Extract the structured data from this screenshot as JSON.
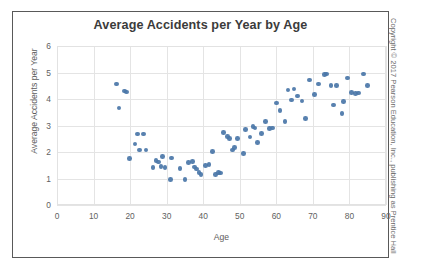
{
  "figure": {
    "copyright": "Copyright © 2017 Pearson Education, Inc., publishing as Prentice Hall"
  },
  "chart_data": {
    "type": "scatter",
    "title": "Average Accidents per Year by Age",
    "xlabel": "Age",
    "ylabel": "Average Accidents per Year",
    "xlim": [
      0,
      90
    ],
    "ylim": [
      0,
      6
    ],
    "xticks": [
      0,
      10,
      20,
      30,
      40,
      50,
      60,
      70,
      80,
      90
    ],
    "yticks": [
      0,
      1,
      2,
      3,
      4,
      5,
      6
    ],
    "grid": true,
    "legend": null,
    "marker_color": "#4a76a8",
    "series": [
      {
        "name": "Drivers",
        "points": [
          [
            16.2,
            4.56
          ],
          [
            17.0,
            3.66
          ],
          [
            18.4,
            4.3
          ],
          [
            19.0,
            4.27
          ],
          [
            19.8,
            1.75
          ],
          [
            21.3,
            2.3
          ],
          [
            22.0,
            2.68
          ],
          [
            22.6,
            2.08
          ],
          [
            23.6,
            2.68
          ],
          [
            24.4,
            2.08
          ],
          [
            26.3,
            1.41
          ],
          [
            27.1,
            1.68
          ],
          [
            27.8,
            1.63
          ],
          [
            28.4,
            1.45
          ],
          [
            28.8,
            1.82
          ],
          [
            29.5,
            1.41
          ],
          [
            31.0,
            0.97
          ],
          [
            31.4,
            1.78
          ],
          [
            33.6,
            1.38
          ],
          [
            35.0,
            0.97
          ],
          [
            36.0,
            1.6
          ],
          [
            37.0,
            1.64
          ],
          [
            37.6,
            1.44
          ],
          [
            38.2,
            1.36
          ],
          [
            38.8,
            1.22
          ],
          [
            39.4,
            1.14
          ],
          [
            40.6,
            1.49
          ],
          [
            41.6,
            1.53
          ],
          [
            42.6,
            2.02
          ],
          [
            43.4,
            1.16
          ],
          [
            44.2,
            1.22
          ],
          [
            44.8,
            1.2
          ],
          [
            45.6,
            2.74
          ],
          [
            46.6,
            2.58
          ],
          [
            47.2,
            2.5
          ],
          [
            48.0,
            2.08
          ],
          [
            48.6,
            2.16
          ],
          [
            49.4,
            2.52
          ],
          [
            51.0,
            1.95
          ],
          [
            51.6,
            2.84
          ],
          [
            52.8,
            2.56
          ],
          [
            53.6,
            2.96
          ],
          [
            54.2,
            2.9
          ],
          [
            54.8,
            2.36
          ],
          [
            56.0,
            2.7
          ],
          [
            57.0,
            3.16
          ],
          [
            58.2,
            2.88
          ],
          [
            59.0,
            2.9
          ],
          [
            60.0,
            3.85
          ],
          [
            61.0,
            3.56
          ],
          [
            62.4,
            3.14
          ],
          [
            63.2,
            4.34
          ],
          [
            64.2,
            3.96
          ],
          [
            64.8,
            4.38
          ],
          [
            65.8,
            4.12
          ],
          [
            67.0,
            3.92
          ],
          [
            68.0,
            3.27
          ],
          [
            69.0,
            4.72
          ],
          [
            70.4,
            4.18
          ],
          [
            71.6,
            4.56
          ],
          [
            73.2,
            4.92
          ],
          [
            73.8,
            4.95
          ],
          [
            75.0,
            4.5
          ],
          [
            75.6,
            3.77
          ],
          [
            76.4,
            4.5
          ],
          [
            78.0,
            3.45
          ],
          [
            78.4,
            3.9
          ],
          [
            79.4,
            4.8
          ],
          [
            80.6,
            4.24
          ],
          [
            81.6,
            4.2
          ],
          [
            82.4,
            4.22
          ],
          [
            83.8,
            4.94
          ],
          [
            85.0,
            4.52
          ]
        ]
      }
    ]
  }
}
